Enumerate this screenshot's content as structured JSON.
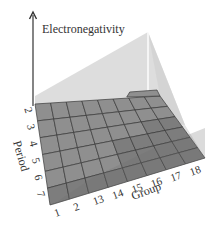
{
  "title": "Electronegativity",
  "axes": {
    "vertical_label": "Electronegativity",
    "period_label": "Period",
    "group_label": "Group"
  },
  "period_ticks": [
    "2",
    "3",
    "4",
    "5",
    "6",
    "7"
  ],
  "group_ticks": [
    "1",
    "2",
    "13",
    "14",
    "15",
    "16",
    "17",
    "18"
  ],
  "colors": {
    "grid_fill": "#8f8f8f",
    "grid_fill_dark": "#7d7d7d",
    "grid_line": "#3a3a3a",
    "plane": "#d4d4d4",
    "axis": "#333333",
    "highlight_line": "#ffffff"
  },
  "chart_data": {
    "type": "diagram",
    "title": "Electronegativity",
    "xlabel": "Group",
    "ylabel": "Period",
    "zlabel": "Electronegativity",
    "x_ticks": [
      "1",
      "2",
      "13",
      "14",
      "15",
      "16",
      "17",
      "18"
    ],
    "y_ticks": [
      "2",
      "3",
      "4",
      "5",
      "6",
      "7"
    ],
    "trend": "increases left-to-right across groups and bottom-to-top up periods"
  }
}
